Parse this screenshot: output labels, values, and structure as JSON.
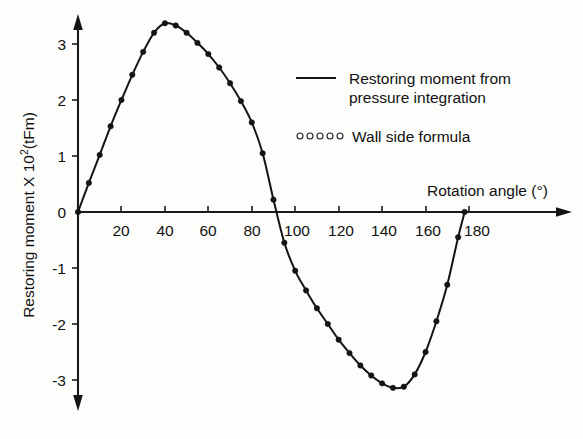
{
  "chart_data": {
    "type": "line",
    "title": "",
    "xlabel": "Rotation angle (°)",
    "ylabel": "Restoring moment X 10²(tFm)",
    "ylabel_main": "Restoring moment X 10",
    "ylabel_exp": "2",
    "ylabel_unit": "(tFm)",
    "xlim": [
      0,
      190
    ],
    "ylim": [
      -3.45,
      3.6
    ],
    "xticks": [
      0,
      20,
      40,
      60,
      80,
      100,
      120,
      140,
      160,
      180
    ],
    "xticklabels": [
      "",
      "20",
      "40",
      "60",
      "80",
      "100",
      "120",
      "140",
      "160",
      "180"
    ],
    "yticks": [
      3,
      2,
      1,
      0,
      -1,
      -2,
      -3
    ],
    "yticklabels": [
      "3",
      "2",
      "1",
      "0",
      "-1",
      "-2",
      "-3"
    ],
    "grid": false,
    "legend_position": "upper-right-inside",
    "axis_color": "#141414",
    "series": [
      {
        "name": "Restoring moment from pressure integration",
        "marker": "line",
        "legend_label_line1": "Restoring moment from",
        "legend_label_line2": "pressure integration",
        "x": [
          0,
          5,
          10,
          15,
          20,
          25,
          30,
          35,
          40,
          45,
          50,
          55,
          60,
          65,
          70,
          75,
          80,
          85,
          90,
          95,
          100,
          105,
          110,
          115,
          120,
          125,
          130,
          135,
          140,
          145,
          150,
          155,
          160,
          165,
          170,
          175,
          178
        ],
        "y": [
          0.0,
          0.52,
          1.02,
          1.53,
          2.0,
          2.45,
          2.86,
          3.2,
          3.37,
          3.33,
          3.2,
          3.02,
          2.82,
          2.58,
          2.3,
          1.98,
          1.6,
          1.05,
          0.22,
          -0.55,
          -1.05,
          -1.4,
          -1.72,
          -2.0,
          -2.28,
          -2.52,
          -2.74,
          -2.92,
          -3.06,
          -3.14,
          -3.12,
          -2.9,
          -2.5,
          -1.95,
          -1.3,
          -0.45,
          0.0
        ]
      },
      {
        "name": "Wall side formula",
        "marker": "circle",
        "legend_label_line1": "Wall side formula",
        "legend_marker_count": 5
      }
    ]
  },
  "legend": {
    "entry1_line1": "Restoring moment from",
    "entry1_line2": "pressure integration",
    "entry2_label": "Wall side formula"
  },
  "axes": {
    "x_title": "Rotation angle (°)",
    "y_title_main": "Restoring moment X 10",
    "y_title_exp": "2",
    "y_title_unit": "(tFm)"
  }
}
